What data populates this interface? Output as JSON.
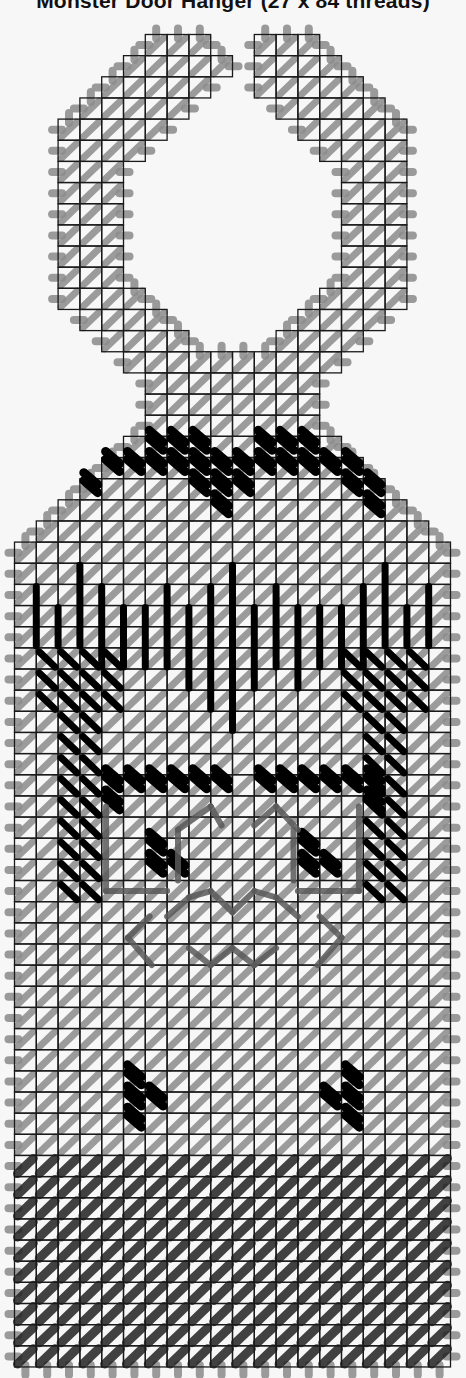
{
  "title": "Monster Door Hanger (27 x 84 threads)",
  "grid": {
    "x0": 14.5,
    "y0": 34.5,
    "cw": 21.8,
    "ch": 21.15,
    "cols": 20,
    "rows": 63
  },
  "colors": {
    "background": "#f7f7f7",
    "grid_line": "#1a1a1a",
    "overcast": "#9a9a9a",
    "tent_light": "#8c8c8c",
    "tent_dark": "#222222",
    "accent_black": "#000000",
    "backstitch": "#5a5a5a",
    "faint": "#c8c8c8"
  },
  "shape": {
    "rows": [
      [
        0,
        6,
        8
      ],
      [
        0,
        11,
        13
      ],
      [
        1,
        5,
        9
      ],
      [
        1,
        11,
        14
      ],
      [
        2,
        4,
        8
      ],
      [
        2,
        11,
        15
      ],
      [
        3,
        3,
        7
      ],
      [
        3,
        12,
        16
      ],
      [
        4,
        2,
        6
      ],
      [
        4,
        13,
        17
      ],
      [
        5,
        2,
        5
      ],
      [
        5,
        14,
        17
      ],
      [
        6,
        2,
        4
      ],
      [
        6,
        15,
        17
      ],
      [
        7,
        2,
        4
      ],
      [
        7,
        15,
        17
      ],
      [
        8,
        2,
        4
      ],
      [
        8,
        15,
        17
      ],
      [
        9,
        2,
        4
      ],
      [
        9,
        15,
        17
      ],
      [
        10,
        2,
        4
      ],
      [
        10,
        15,
        17
      ],
      [
        11,
        2,
        4
      ],
      [
        11,
        15,
        17
      ],
      [
        12,
        2,
        5
      ],
      [
        12,
        14,
        17
      ],
      [
        13,
        3,
        6
      ],
      [
        13,
        13,
        16
      ],
      [
        14,
        4,
        7
      ],
      [
        14,
        12,
        15
      ],
      [
        15,
        5,
        14
      ],
      [
        16,
        6,
        13
      ],
      [
        17,
        6,
        13
      ],
      [
        18,
        6,
        13
      ],
      [
        19,
        5,
        14
      ],
      [
        20,
        4,
        15
      ],
      [
        21,
        3,
        16
      ],
      [
        22,
        2,
        17
      ],
      [
        23,
        1,
        18
      ],
      [
        24,
        0,
        19
      ]
    ],
    "full_body_start_row": 24,
    "full_body_end_row": 62
  },
  "stitches": {
    "eyebrow_dots": [
      [
        19,
        6
      ],
      [
        19,
        7
      ],
      [
        19,
        8
      ],
      [
        19,
        11
      ],
      [
        19,
        12
      ],
      [
        19,
        13
      ],
      [
        20,
        4
      ],
      [
        20,
        5
      ],
      [
        20,
        6
      ],
      [
        20,
        7
      ],
      [
        20,
        8
      ],
      [
        20,
        9
      ],
      [
        20,
        10
      ],
      [
        20,
        11
      ],
      [
        20,
        12
      ],
      [
        20,
        13
      ],
      [
        20,
        14
      ],
      [
        20,
        15
      ],
      [
        21,
        3
      ],
      [
        21,
        8
      ],
      [
        21,
        9
      ],
      [
        21,
        10
      ],
      [
        21,
        15
      ],
      [
        21,
        16
      ],
      [
        22,
        9
      ],
      [
        22,
        16
      ]
    ],
    "hair_bars": [
      [
        1,
        26,
        29
      ],
      [
        2,
        27,
        29
      ],
      [
        3,
        25,
        29
      ],
      [
        4,
        26,
        30
      ],
      [
        5,
        27,
        30
      ],
      [
        6,
        27,
        30
      ],
      [
        7,
        26,
        30
      ],
      [
        8,
        27,
        31
      ],
      [
        9,
        26,
        32
      ],
      [
        10,
        25,
        33
      ],
      [
        11,
        27,
        31
      ],
      [
        12,
        26,
        30
      ],
      [
        13,
        27,
        31
      ],
      [
        14,
        27,
        30
      ],
      [
        15,
        27,
        30
      ],
      [
        16,
        26,
        30
      ],
      [
        17,
        25,
        29
      ],
      [
        18,
        27,
        29
      ],
      [
        19,
        26,
        29
      ]
    ],
    "arms_left": {
      "cols": [
        1,
        2,
        3,
        4
      ],
      "rows_full": [
        29,
        30,
        31
      ],
      "rows_two": [
        32,
        33,
        34,
        35,
        36,
        37,
        38,
        39,
        40
      ]
    },
    "arms_right": {
      "cols": [
        15,
        16,
        17,
        18
      ],
      "rows_full": [
        29,
        30,
        31
      ],
      "rows_two": [
        32,
        33,
        34,
        35,
        36,
        37,
        38,
        39,
        40
      ]
    },
    "eye_frame_top": [
      [
        35,
        4
      ],
      [
        35,
        5
      ],
      [
        35,
        6
      ],
      [
        35,
        7
      ],
      [
        35,
        8
      ],
      [
        35,
        9
      ],
      [
        35,
        11
      ],
      [
        35,
        12
      ],
      [
        35,
        13
      ],
      [
        35,
        14
      ],
      [
        35,
        15
      ],
      [
        35,
        16
      ],
      [
        36,
        4
      ],
      [
        36,
        16
      ]
    ],
    "eye_pupils": [
      [
        38,
        6
      ],
      [
        39,
        6
      ],
      [
        39,
        7
      ],
      [
        38,
        13
      ],
      [
        39,
        13
      ],
      [
        39,
        14
      ]
    ],
    "lower_dots": [
      [
        49,
        5
      ],
      [
        50,
        5
      ],
      [
        50,
        6
      ],
      [
        51,
        5
      ],
      [
        49,
        15
      ],
      [
        50,
        14
      ],
      [
        50,
        15
      ],
      [
        51,
        15
      ]
    ],
    "dark_rows_start": 53
  },
  "backstitch_lines": [
    [
      [
        5.2,
        42.7
      ],
      [
        6.2,
        41.7
      ]
    ],
    [
      [
        5.2,
        42.7
      ],
      [
        6.3,
        44.0
      ]
    ],
    [
      [
        15.0,
        42.7
      ],
      [
        14.0,
        41.7
      ]
    ],
    [
      [
        15.0,
        42.7
      ],
      [
        13.9,
        44.0
      ]
    ],
    [
      [
        7.0,
        41.7
      ],
      [
        8.0,
        40.8
      ]
    ],
    [
      [
        8.0,
        40.8
      ],
      [
        9.0,
        40.5
      ]
    ],
    [
      [
        9.0,
        40.5
      ],
      [
        10.0,
        41.5
      ]
    ],
    [
      [
        10.0,
        41.5
      ],
      [
        11.0,
        40.5
      ]
    ],
    [
      [
        11.0,
        40.5
      ],
      [
        12.0,
        40.8
      ]
    ],
    [
      [
        12.0,
        40.8
      ],
      [
        13.0,
        41.7
      ]
    ],
    [
      [
        8.0,
        43.2
      ],
      [
        9.0,
        44.0
      ]
    ],
    [
      [
        9.0,
        44.0
      ],
      [
        10.0,
        43.2
      ]
    ],
    [
      [
        10.0,
        43.2
      ],
      [
        11.0,
        44.0
      ]
    ],
    [
      [
        11.0,
        44.0
      ],
      [
        12.0,
        43.2
      ]
    ],
    [
      [
        4.2,
        36.5
      ],
      [
        4.2,
        40.5
      ]
    ],
    [
      [
        15.8,
        36.5
      ],
      [
        15.8,
        40.5
      ]
    ],
    [
      [
        4.2,
        40.5
      ],
      [
        7.0,
        40.5
      ]
    ],
    [
      [
        13.0,
        40.5
      ],
      [
        15.8,
        40.5
      ]
    ],
    [
      [
        7.5,
        37.6
      ],
      [
        9.0,
        36.5
      ]
    ],
    [
      [
        9.0,
        36.5
      ],
      [
        9.5,
        37.4
      ]
    ],
    [
      [
        11.0,
        37.4
      ],
      [
        12.0,
        36.5
      ]
    ],
    [
      [
        12.0,
        36.5
      ],
      [
        13.0,
        37.6
      ]
    ],
    [
      [
        7.5,
        37.6
      ],
      [
        7.5,
        40.0
      ]
    ],
    [
      [
        12.8,
        37.6
      ],
      [
        12.8,
        40.0
      ]
    ]
  ]
}
